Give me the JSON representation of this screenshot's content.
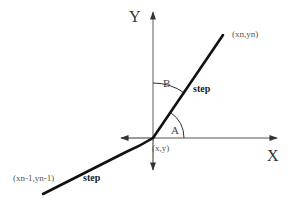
{
  "diagram": {
    "axes": {
      "x_label": "X",
      "y_label": "Y"
    },
    "points": {
      "origin": "(x,y)",
      "next": "(xn,yn)",
      "previous": "(xn-1,yn-1)"
    },
    "angles": {
      "a": "A",
      "b": "B"
    },
    "segments": {
      "upper_step": "step",
      "lower_step": "step"
    },
    "colors": {
      "axis": "#555555",
      "step_line": "#111111",
      "arc": "#333333",
      "background": "#ffffff"
    }
  }
}
